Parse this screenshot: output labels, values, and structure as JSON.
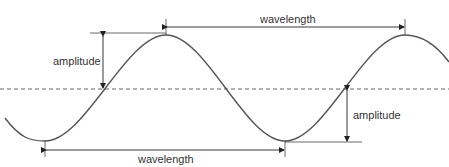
{
  "diagram": {
    "title": "",
    "labels": {
      "wavelength_top": "wavelength",
      "wavelength_bottom": "wavelength",
      "amplitude_left": "amplitude",
      "amplitude_right": "amplitude"
    },
    "colors": {
      "wave": "#555555",
      "lines": "#333333",
      "dashed_axis": "#666666"
    }
  }
}
